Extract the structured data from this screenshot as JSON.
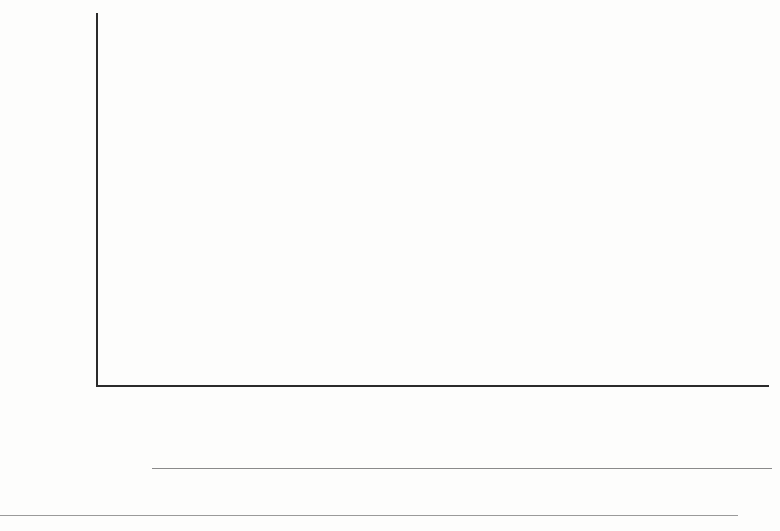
{
  "axes": {
    "y_label": "%",
    "y_ticks": [
      0,
      20,
      40,
      60,
      80,
      100
    ]
  },
  "groups": [
    {
      "name": "Original income",
      "categories": [
        "2005/06",
        "2010/11",
        "2016/17"
      ]
    },
    {
      "name": "Post-tax income",
      "categories": [
        "2005/06",
        "2010/11",
        "2016/17"
      ]
    }
  ],
  "legend": {
    "items": [
      {
        "label": "Richest",
        "color": "#e9e9e7"
      },
      {
        "label": "4th",
        "color": "#bdbdbb"
      },
      {
        "label": "3rd",
        "color": "#8e8e8c"
      },
      {
        "label": "2nd",
        "color": "#4f4f4e"
      },
      {
        "label": "Poorest",
        "color": "#0d0d0d"
      }
    ]
  },
  "source": {
    "text": "Source: Office for National Statistics (ONS)"
  },
  "chart_data": {
    "type": "bar",
    "title": "",
    "subtitle": "",
    "xlabel": "",
    "ylabel": "%",
    "ylim": [
      0,
      100
    ],
    "grid": true,
    "stacked": true,
    "legend_position": "bottom",
    "categories": [
      "Original income 2005/06",
      "Original income 2010/11",
      "Original income 2016/17",
      "Post-tax income 2005/06",
      "Post-tax income 2010/11",
      "Post-tax income 2016/17"
    ],
    "series": [
      {
        "name": "Poorest",
        "color": "#0d0d0d",
        "values": [
          3.0,
          3.5,
          4.5,
          5.5,
          5.0,
          5.0
        ]
      },
      {
        "name": "2nd",
        "color": "#4f4f4e",
        "values": [
          10.0,
          9.5,
          10.5,
          12.0,
          12.0,
          13.5
        ]
      },
      {
        "name": "3rd",
        "color": "#8e8e8c",
        "values": [
          18.0,
          16.0,
          16.0,
          16.5,
          16.0,
          16.0
        ]
      },
      {
        "name": "4th",
        "color": "#bdbdbb",
        "values": [
          23.0,
          24.0,
          24.0,
          21.5,
          22.0,
          22.5
        ]
      },
      {
        "name": "Richest",
        "color": "#e9e9e7",
        "values": [
          46.0,
          47.0,
          45.0,
          44.5,
          45.0,
          43.0
        ]
      }
    ],
    "cumulative_tops": [
      [
        3.0,
        13.0,
        31.0,
        54.0,
        100.0
      ],
      [
        3.5,
        13.0,
        29.0,
        53.0,
        100.0
      ],
      [
        4.5,
        15.0,
        31.0,
        55.0,
        100.0
      ],
      [
        5.5,
        17.5,
        34.0,
        55.5,
        100.0
      ],
      [
        5.0,
        17.0,
        33.0,
        55.0,
        100.0
      ],
      [
        5.0,
        18.5,
        34.5,
        57.0,
        100.0
      ]
    ]
  },
  "layout": {
    "plot_left": 97,
    "plot_right": 769,
    "plot_top": 14,
    "plot_bottom": 385,
    "bar_width": 60,
    "bar_centers": [
      132,
      222,
      312,
      486,
      576,
      666
    ],
    "group_label_centers": [
      222,
      590
    ]
  }
}
